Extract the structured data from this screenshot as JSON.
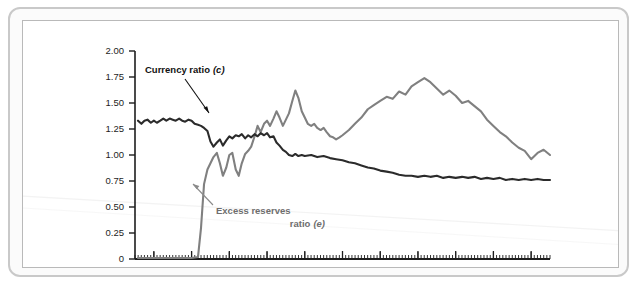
{
  "figure": {
    "background_color": "#ffffff",
    "frame_color": "#c9c9c9",
    "inner_border_color": "#b9b9b9"
  },
  "chart_data": {
    "type": "line",
    "title": "",
    "subtitle": "",
    "xlabel": "",
    "ylabel": "",
    "xlim": [
      2006.5,
      2017.5
    ],
    "ylim": [
      0,
      2.0
    ],
    "grid": false,
    "legend_position": "inline-annotations",
    "y_ticks": [
      "0",
      "0.25",
      "0.50",
      "0.75",
      "1.00",
      "1.25",
      "1.50",
      "1.75",
      "2.00"
    ],
    "y_tick_values": [
      0,
      0.25,
      0.5,
      0.75,
      1.0,
      1.25,
      1.5,
      1.75,
      2.0
    ],
    "x_ticks": [
      "2007",
      "2008",
      "2009",
      "2010",
      "2011",
      "2012",
      "2013",
      "2014",
      "2015",
      "2016",
      "2017"
    ],
    "x_tick_values": [
      2007,
      2008,
      2009,
      2010,
      2011,
      2012,
      2013,
      2014,
      2015,
      2016,
      2017
    ],
    "minor_tick_interval_months": 1,
    "annotations": [
      {
        "name": "currency-ratio-label",
        "text": "Currency ratio (c)",
        "text_plain": "Currency ratio",
        "symbol": "c",
        "color": "#111111",
        "points_to_series": "Currency ratio (c)"
      },
      {
        "name": "excess-reserves-label",
        "line1": "Excess reserves",
        "line2": "ratio (e)",
        "text_plain": "Excess reserves ratio",
        "symbol": "e",
        "color": "#6e6e6e",
        "points_to_series": "Excess reserves ratio (e)"
      }
    ],
    "series": [
      {
        "name": "Currency ratio (c)",
        "short_name": "c",
        "color": "#2b2b2b",
        "x": [
          2006.58,
          2006.67,
          2006.75,
          2006.83,
          2006.92,
          2007.0,
          2007.08,
          2007.17,
          2007.25,
          2007.33,
          2007.42,
          2007.5,
          2007.58,
          2007.67,
          2007.75,
          2007.83,
          2007.92,
          2008.0,
          2008.08,
          2008.17,
          2008.25,
          2008.33,
          2008.42,
          2008.5,
          2008.58,
          2008.67,
          2008.75,
          2008.83,
          2008.92,
          2009.0,
          2009.08,
          2009.17,
          2009.25,
          2009.33,
          2009.42,
          2009.5,
          2009.58,
          2009.67,
          2009.75,
          2009.83,
          2009.92,
          2010.0,
          2010.08,
          2010.17,
          2010.25,
          2010.33,
          2010.42,
          2010.5,
          2010.58,
          2010.67,
          2010.75,
          2010.83,
          2010.92,
          2011.0,
          2011.17,
          2011.33,
          2011.5,
          2011.67,
          2011.83,
          2012.0,
          2012.17,
          2012.33,
          2012.5,
          2012.67,
          2012.83,
          2013.0,
          2013.17,
          2013.33,
          2013.5,
          2013.67,
          2013.83,
          2014.0,
          2014.17,
          2014.33,
          2014.5,
          2014.67,
          2014.83,
          2015.0,
          2015.17,
          2015.33,
          2015.5,
          2015.67,
          2015.83,
          2016.0,
          2016.17,
          2016.33,
          2016.5,
          2016.67,
          2016.83,
          2017.0,
          2017.17,
          2017.33,
          2017.5
        ],
        "y": [
          1.33,
          1.3,
          1.33,
          1.34,
          1.31,
          1.33,
          1.31,
          1.33,
          1.35,
          1.33,
          1.35,
          1.34,
          1.33,
          1.35,
          1.33,
          1.32,
          1.34,
          1.33,
          1.3,
          1.29,
          1.28,
          1.26,
          1.23,
          1.13,
          1.08,
          1.12,
          1.15,
          1.09,
          1.14,
          1.18,
          1.16,
          1.19,
          1.18,
          1.2,
          1.16,
          1.19,
          1.17,
          1.2,
          1.18,
          1.21,
          1.19,
          1.21,
          1.17,
          1.18,
          1.12,
          1.09,
          1.05,
          1.03,
          1.0,
          0.99,
          1.01,
          0.99,
          1.0,
          0.99,
          1.0,
          0.98,
          0.99,
          0.97,
          0.96,
          0.95,
          0.93,
          0.92,
          0.9,
          0.88,
          0.87,
          0.85,
          0.84,
          0.83,
          0.81,
          0.8,
          0.8,
          0.79,
          0.8,
          0.79,
          0.8,
          0.78,
          0.79,
          0.78,
          0.79,
          0.78,
          0.79,
          0.77,
          0.78,
          0.77,
          0.78,
          0.76,
          0.77,
          0.76,
          0.77,
          0.76,
          0.77,
          0.76,
          0.76
        ],
        "value_at_start": 1.33,
        "value_at_end": 0.76
      },
      {
        "name": "Excess reserves ratio (e)",
        "short_name": "e",
        "color": "#808080",
        "x": [
          2006.58,
          2007.0,
          2007.5,
          2008.0,
          2008.17,
          2008.25,
          2008.33,
          2008.42,
          2008.5,
          2008.58,
          2008.67,
          2008.75,
          2008.83,
          2008.92,
          2009.0,
          2009.08,
          2009.17,
          2009.25,
          2009.33,
          2009.42,
          2009.5,
          2009.58,
          2009.67,
          2009.75,
          2009.83,
          2009.92,
          2010.0,
          2010.08,
          2010.17,
          2010.25,
          2010.33,
          2010.42,
          2010.5,
          2010.58,
          2010.67,
          2010.75,
          2010.83,
          2010.92,
          2011.0,
          2011.08,
          2011.17,
          2011.25,
          2011.33,
          2011.42,
          2011.5,
          2011.58,
          2011.67,
          2011.75,
          2011.83,
          2011.92,
          2012.0,
          2012.17,
          2012.33,
          2012.5,
          2012.67,
          2012.83,
          2013.0,
          2013.17,
          2013.33,
          2013.5,
          2013.67,
          2013.83,
          2014.0,
          2014.17,
          2014.33,
          2014.5,
          2014.67,
          2014.83,
          2015.0,
          2015.17,
          2015.33,
          2015.5,
          2015.67,
          2015.83,
          2016.0,
          2016.17,
          2016.33,
          2016.5,
          2016.67,
          2016.83,
          2017.0,
          2017.17,
          2017.33,
          2017.5
        ],
        "y": [
          0.01,
          0.01,
          0.01,
          0.01,
          0.02,
          0.3,
          0.72,
          0.86,
          0.92,
          0.98,
          1.02,
          0.92,
          0.8,
          0.88,
          1.0,
          1.02,
          0.86,
          0.8,
          0.92,
          1.01,
          1.04,
          1.08,
          1.18,
          1.28,
          1.22,
          1.3,
          1.33,
          1.28,
          1.35,
          1.42,
          1.36,
          1.28,
          1.34,
          1.4,
          1.52,
          1.62,
          1.55,
          1.42,
          1.36,
          1.3,
          1.28,
          1.3,
          1.26,
          1.24,
          1.26,
          1.22,
          1.18,
          1.17,
          1.15,
          1.17,
          1.19,
          1.24,
          1.3,
          1.36,
          1.44,
          1.48,
          1.52,
          1.56,
          1.54,
          1.61,
          1.58,
          1.66,
          1.7,
          1.74,
          1.7,
          1.64,
          1.58,
          1.62,
          1.57,
          1.5,
          1.52,
          1.47,
          1.42,
          1.34,
          1.28,
          1.22,
          1.18,
          1.12,
          1.07,
          1.04,
          0.96,
          1.02,
          1.05,
          1.0
        ],
        "value_at_start": 0.01,
        "value_at_end": 1.0,
        "takeoff_year": 2008.3,
        "peak_value": 1.74,
        "peak_year": 2014.2
      }
    ]
  }
}
